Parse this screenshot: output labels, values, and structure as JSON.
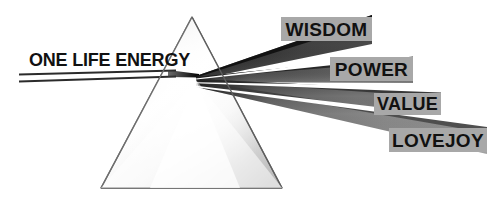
{
  "diagram": {
    "title": "ONE LIFE ENERGY",
    "type": "prism-refraction-diagram",
    "input_beam": {
      "label": "ONE LIFE ENERGY",
      "stroke_color": "#2b2b2b"
    },
    "prism": {
      "name": "triangular-prism",
      "outline_color": "#6b6b6b",
      "fill_light": "#ffffff",
      "fill_shadow": "#b5b5b5"
    },
    "output_beams": [
      {
        "label": "WISDOM",
        "order": 1,
        "beam_color": "#3b3b3b",
        "box_color": "#a8a8a8",
        "text_color": "#111111"
      },
      {
        "label": "POWER",
        "order": 2,
        "beam_color": "#555555",
        "box_color": "#a8a8a8",
        "text_color": "#111111"
      },
      {
        "label": "VALUE",
        "order": 3,
        "beam_color": "#6d6d6d",
        "box_color": "#a8a8a8",
        "text_color": "#111111"
      },
      {
        "label": "LOVEJOY",
        "order": 4,
        "beam_color": "#7d7d7d",
        "box_color": "#a8a8a8",
        "text_color": "#111111"
      }
    ],
    "background_color": "#ffffff"
  }
}
